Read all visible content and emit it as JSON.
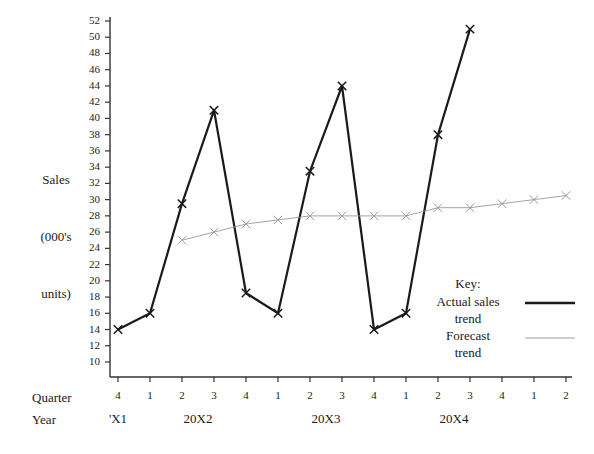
{
  "axis_titles": {
    "y_line1": "Sales",
    "y_line2": "(000's",
    "y_line3": "units)",
    "quarter_row": "Quarter",
    "year_row": "Year"
  },
  "legend": {
    "title": "Key:",
    "actual_line1": "Actual sales",
    "actual_line2": "trend",
    "forecast_line1": "Forecast",
    "forecast_line2": "trend",
    "actual_color": "#1a1a1a",
    "forecast_color": "#9a9a9a"
  },
  "chart_data": {
    "type": "line",
    "title": "",
    "xlabel": "Quarter / Year",
    "ylabel": "Sales (000's units)",
    "ylim": [
      10,
      52
    ],
    "ytick_step": 2,
    "yticks": [
      10,
      12,
      14,
      16,
      18,
      20,
      22,
      24,
      26,
      28,
      30,
      32,
      34,
      36,
      38,
      40,
      42,
      44,
      46,
      48,
      50,
      52
    ],
    "grid": false,
    "legend_position": "right-inside",
    "categories": [
      "4",
      "1",
      "2",
      "3",
      "4",
      "1",
      "2",
      "3",
      "4",
      "1",
      "2",
      "3",
      "4",
      "1",
      "2"
    ],
    "year_groups": [
      {
        "label": "'X1",
        "start_index": 0,
        "end_index": 0
      },
      {
        "label": "20X2",
        "start_index": 1,
        "end_index": 4
      },
      {
        "label": "20X3",
        "start_index": 5,
        "end_index": 8
      },
      {
        "label": "20X4",
        "start_index": 9,
        "end_index": 12
      }
    ],
    "series": [
      {
        "name": "Actual sales trend",
        "marker": "x",
        "color": "#1a1a1a",
        "width": 2.2,
        "x": [
          "4",
          "1",
          "2",
          "3",
          "4",
          "1",
          "2",
          "3",
          "4",
          "1",
          "2",
          "3"
        ],
        "values": [
          14,
          16,
          29.5,
          41,
          18.5,
          16,
          33.5,
          44,
          14,
          16,
          38,
          51
        ]
      },
      {
        "name": "Forecast trend",
        "marker": "x",
        "color": "#9a9a9a",
        "width": 0.9,
        "x": [
          "2",
          "3",
          "4",
          "1",
          "2",
          "3",
          "4",
          "1",
          "2",
          "3",
          "4",
          "1",
          "2"
        ],
        "values": [
          25,
          26,
          27,
          27.5,
          28,
          28,
          28,
          28,
          29,
          29,
          29.5,
          30,
          30.5
        ]
      }
    ]
  }
}
